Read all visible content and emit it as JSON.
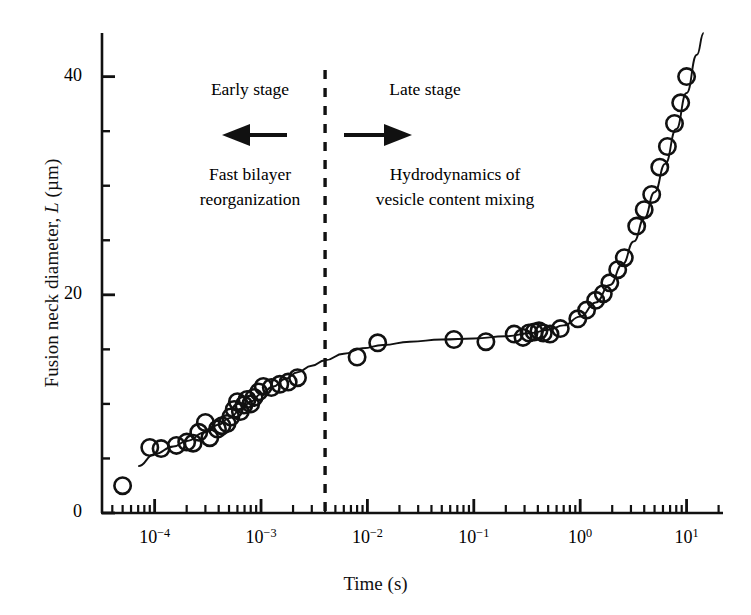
{
  "figure": {
    "background": "#ffffff",
    "ink_color": "#111111",
    "width": 751,
    "height": 615
  },
  "axes": {
    "x_label": "Time (s)",
    "y_label_prefix": "Fusion neck diameter, ",
    "y_label_italic": "L",
    "y_label_suffix": " (µm)",
    "y_label_full": "Fusion neck diameter, L (µm)",
    "x_tick_labels": [
      "10−4",
      "10−3",
      "10−2",
      "10−1",
      "10⁰",
      "10¹"
    ],
    "x_tick_mantissa": "10",
    "x_tick_exponents": [
      "-4",
      "-3",
      "-2",
      "-1",
      "0",
      "1"
    ],
    "y_tick_labels": [
      "0",
      "20",
      "40"
    ],
    "y_tick_values": [
      0,
      20,
      40
    ],
    "y_minor_step": 5
  },
  "annotations": {
    "divider_label": "stage-divider-dashed-line",
    "divider_time_s": 0.004,
    "early": {
      "title": "Early stage",
      "arrow": "left-arrow-icon",
      "caption_line1": "Fast bilayer",
      "caption_line2": "reorganization"
    },
    "late": {
      "title": "Late stage",
      "arrow": "right-arrow-icon",
      "caption_line1": "Hydrodynamics of",
      "caption_line2": "vesicle content mixing"
    }
  },
  "chart_data": {
    "type": "scatter",
    "title": "",
    "xlabel": "Time (s)",
    "ylabel": "Fusion neck diameter, L (µm)",
    "xscale": "log",
    "yscale": "linear",
    "xlim": [
      3.2e-05,
      22.0
    ],
    "ylim": [
      0,
      44
    ],
    "grid": false,
    "legend": null,
    "marker": "open-circle",
    "marker_edge_color": "#111111",
    "marker_face_color": "none",
    "series": [
      {
        "name": "Fusion neck diameter measurements",
        "points": [
          [
            5e-05,
            2.5
          ],
          [
            9e-05,
            6.0
          ],
          [
            0.000115,
            5.9
          ],
          [
            0.00016,
            6.2
          ],
          [
            0.0002,
            6.5
          ],
          [
            0.00023,
            6.4
          ],
          [
            0.00026,
            7.4
          ],
          [
            0.0003,
            8.3
          ],
          [
            0.00033,
            6.9
          ],
          [
            0.00039,
            7.7
          ],
          [
            0.00043,
            8.0
          ],
          [
            0.00048,
            8.2
          ],
          [
            0.00052,
            8.8
          ],
          [
            0.00056,
            9.5
          ],
          [
            0.0006,
            10.2
          ],
          [
            0.00064,
            9.3
          ],
          [
            0.00069,
            9.9
          ],
          [
            0.00074,
            10.4
          ],
          [
            0.0008,
            10.0
          ],
          [
            0.00086,
            10.6
          ],
          [
            0.00095,
            11.1
          ],
          [
            0.00105,
            11.6
          ],
          [
            0.00125,
            11.5
          ],
          [
            0.0015,
            11.8
          ],
          [
            0.0018,
            12.0
          ],
          [
            0.0022,
            12.4
          ],
          [
            0.008,
            14.3
          ],
          [
            0.0125,
            15.6
          ],
          [
            0.065,
            15.9
          ],
          [
            0.13,
            15.7
          ],
          [
            0.24,
            16.4
          ],
          [
            0.29,
            16.1
          ],
          [
            0.33,
            16.5
          ],
          [
            0.37,
            16.6
          ],
          [
            0.41,
            16.7
          ],
          [
            0.45,
            16.5
          ],
          [
            0.52,
            16.4
          ],
          [
            0.65,
            16.9
          ],
          [
            0.95,
            17.8
          ],
          [
            1.15,
            18.6
          ],
          [
            1.4,
            19.5
          ],
          [
            1.65,
            20.1
          ],
          [
            1.9,
            21.1
          ],
          [
            2.25,
            22.3
          ],
          [
            2.6,
            23.4
          ],
          [
            3.4,
            26.3
          ],
          [
            4.0,
            27.8
          ],
          [
            4.7,
            29.2
          ],
          [
            5.6,
            31.7
          ],
          [
            6.6,
            33.6
          ],
          [
            7.7,
            35.7
          ],
          [
            8.8,
            37.6
          ],
          [
            10.0,
            40.0
          ]
        ]
      }
    ],
    "fit_curve": {
      "name": "model fit line",
      "points": [
        [
          7e-05,
          4.3
        ],
        [
          0.0001,
          5.4
        ],
        [
          0.00015,
          6.1
        ],
        [
          0.0002,
          6.6
        ],
        [
          0.0003,
          7.4
        ],
        [
          0.0004,
          8.1
        ],
        [
          0.0005,
          8.7
        ],
        [
          0.00065,
          9.5
        ],
        [
          0.0008,
          10.2
        ],
        [
          0.001,
          10.9
        ],
        [
          0.0013,
          11.6
        ],
        [
          0.0017,
          12.3
        ],
        [
          0.0022,
          12.9
        ],
        [
          0.003,
          13.5
        ],
        [
          0.004,
          14.0
        ],
        [
          0.006,
          14.6
        ],
        [
          0.009,
          15.1
        ],
        [
          0.014,
          15.4
        ],
        [
          0.025,
          15.7
        ],
        [
          0.05,
          15.9
        ],
        [
          0.1,
          16.0
        ],
        [
          0.2,
          16.2
        ],
        [
          0.35,
          16.5
        ],
        [
          0.5,
          16.8
        ],
        [
          0.7,
          17.2
        ],
        [
          1.0,
          18.0
        ],
        [
          1.4,
          19.3
        ],
        [
          1.9,
          20.9
        ],
        [
          2.5,
          22.8
        ],
        [
          3.2,
          24.9
        ],
        [
          4.0,
          27.0
        ],
        [
          5.0,
          29.4
        ],
        [
          6.3,
          32.0
        ],
        [
          8.0,
          35.2
        ],
        [
          10.0,
          38.5
        ],
        [
          12.5,
          42.0
        ],
        [
          14.5,
          44.0
        ]
      ]
    }
  }
}
